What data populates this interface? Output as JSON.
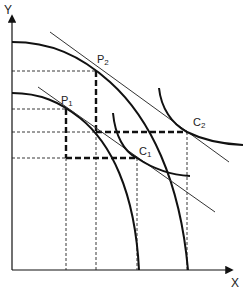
{
  "diagram": {
    "type": "economics-ppf-trade-diagram",
    "axes": {
      "x_label": "X",
      "y_label": "Y"
    },
    "curves": [
      {
        "id": "ppf-inner",
        "kind": "production-possibility-frontier"
      },
      {
        "id": "ppf-outer",
        "kind": "production-possibility-frontier"
      },
      {
        "id": "ic-c1",
        "kind": "indifference-curve"
      },
      {
        "id": "ic-c2",
        "kind": "indifference-curve"
      },
      {
        "id": "price-line-1",
        "kind": "tangent-line"
      },
      {
        "id": "price-line-2",
        "kind": "tangent-line"
      }
    ],
    "points": {
      "p1": {
        "base": "P",
        "sub": "1"
      },
      "p2": {
        "base": "P",
        "sub": "2"
      },
      "c1": {
        "base": "C",
        "sub": "1"
      },
      "c2": {
        "base": "C",
        "sub": "2"
      }
    },
    "colors": {
      "line": "#111111",
      "thin_line": "#333333",
      "background": "#ffffff"
    }
  }
}
